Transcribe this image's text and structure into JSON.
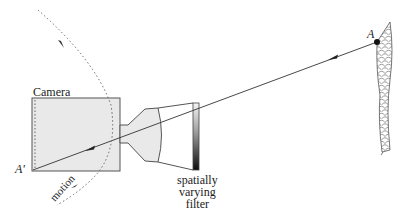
{
  "diagram": {
    "labels": {
      "camera": "Camera",
      "image_point": "A'",
      "scene_point": "A",
      "filter_line1": "spatially",
      "filter_line2": "varying",
      "filter_line3": "filter",
      "motion": "motion"
    },
    "colors": {
      "stroke": "#444444",
      "camera_fill": "#e8e8e8",
      "filter_gradient_top": "#f4f4f4",
      "filter_gradient_bottom": "#111111",
      "background": "#ffffff"
    }
  }
}
